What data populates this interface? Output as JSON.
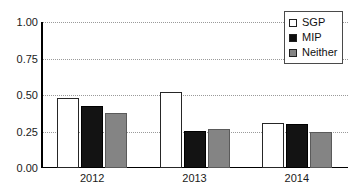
{
  "chart_data": {
    "type": "bar",
    "title": "",
    "subtitle": "",
    "xlabel": "",
    "ylabel": "",
    "categories": [
      "2012",
      "2013",
      "2014"
    ],
    "series": [
      {
        "name": "SGP",
        "color": "#ffffff",
        "values": [
          0.48,
          0.52,
          0.31
        ]
      },
      {
        "name": "MIP",
        "color": "#131313",
        "values": [
          0.425,
          0.255,
          0.3
        ]
      },
      {
        "name": "Neither",
        "color": "#848484",
        "values": [
          0.375,
          0.27,
          0.245
        ]
      }
    ],
    "ylim": [
      0.0,
      1.0
    ],
    "yticks": [
      "0.00",
      "0.25",
      "0.50",
      "0.75",
      "1.00"
    ],
    "ytick_values": [
      0.0,
      0.25,
      0.5,
      0.75,
      1.0
    ],
    "grid": true,
    "grid_style": "dotted-horizontal",
    "legend_position": "top-right",
    "annotations": []
  },
  "legend": {
    "entries": [
      {
        "label": "SGP",
        "swatch": "legend-swatch-sgp"
      },
      {
        "label": "MIP",
        "swatch": "legend-swatch-mip"
      },
      {
        "label": "Neither",
        "swatch": "legend-swatch-neither"
      }
    ]
  },
  "colors": {
    "series_sgp": "#ffffff",
    "series_mip": "#131313",
    "series_neither": "#848484",
    "axis": "#000000",
    "gridline": "#9a9a9a",
    "text": "#1a1a1a",
    "background": "#ffffff"
  }
}
